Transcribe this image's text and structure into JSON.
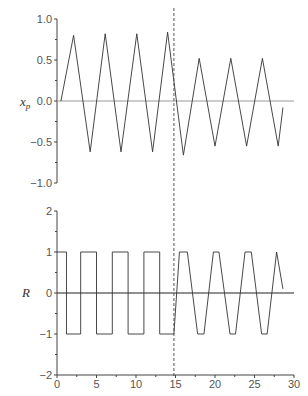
{
  "chart_data": [
    {
      "type": "line",
      "title": "",
      "ylabel": "x_p",
      "xlabel": "",
      "ylim": [
        -1.0,
        1.0
      ],
      "xlim": [
        0,
        30
      ],
      "yticks": [
        "1.0",
        "0.5",
        "0.0",
        "-0.5",
        "-1.0"
      ],
      "grid": false,
      "zero_line": true,
      "vertical_marker_x": 14.8,
      "series": [
        {
          "name": "x_p",
          "x": [
            0.5,
            2.1,
            4.2,
            6.1,
            8.1,
            10.1,
            12.1,
            14.0,
            16.0,
            18.0,
            20.0,
            22.0,
            24.0,
            26.0,
            28.0,
            28.6
          ],
          "values": [
            0.0,
            0.8,
            -0.62,
            0.82,
            -0.62,
            0.82,
            -0.62,
            0.84,
            -0.66,
            0.52,
            -0.55,
            0.52,
            -0.55,
            0.52,
            -0.55,
            -0.08
          ]
        }
      ]
    },
    {
      "type": "line",
      "title": "",
      "ylabel": "R",
      "xlabel": "",
      "ylim": [
        -2,
        2
      ],
      "xlim": [
        0,
        30
      ],
      "yticks": [
        "2",
        "1",
        "0",
        "-1",
        "-2"
      ],
      "xticks": [
        "0",
        "5",
        "10",
        "15",
        "20",
        "25",
        "30"
      ],
      "grid": false,
      "zero_line": true,
      "vertical_marker_x": 14.8,
      "series": [
        {
          "name": "R",
          "x": [
            0,
            1.2,
            1.2,
            3.0,
            3.0,
            5.0,
            5.0,
            7.0,
            7.0,
            9.0,
            9.0,
            11.0,
            11.0,
            13.0,
            13.0,
            14.8,
            15.5,
            16.5,
            17.8,
            18.6,
            19.8,
            20.5,
            21.9,
            22.6,
            23.8,
            24.6,
            25.9,
            26.6,
            27.8,
            28.6
          ],
          "values": [
            1,
            1,
            -1,
            -1,
            1,
            1,
            -1,
            -1,
            1,
            1,
            -1,
            -1,
            1,
            1,
            -1,
            -1,
            1,
            1,
            -1,
            -1,
            1,
            1,
            -1,
            -1,
            1,
            1,
            -1,
            -1,
            1,
            0.1
          ]
        }
      ]
    }
  ],
  "labels": {
    "top_ylabel_main": "x",
    "top_ylabel_sub": "p",
    "bottom_ylabel": "R"
  }
}
